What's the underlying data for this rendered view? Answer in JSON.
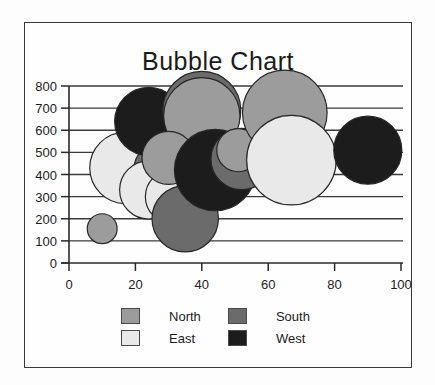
{
  "chart_data": {
    "type": "scatter",
    "title": "Bubble Chart",
    "xlabel": "",
    "ylabel": "",
    "xlim": [
      0,
      100
    ],
    "ylim": [
      0,
      800
    ],
    "xticks": [
      "0",
      "20",
      "40",
      "60",
      "80",
      "100"
    ],
    "yticks": [
      "0",
      "100",
      "200",
      "300",
      "400",
      "500",
      "600",
      "700",
      "800"
    ],
    "grid": "horizontal",
    "legend_position": "bottom",
    "series": [
      {
        "name": "North",
        "color": "#9c9c9c",
        "points": [
          {
            "x": 10,
            "y": 155,
            "size": 90
          },
          {
            "x": 40,
            "y": 665,
            "size": 230
          },
          {
            "x": 30,
            "y": 475,
            "size": 160
          },
          {
            "x": 51,
            "y": 510,
            "size": 130
          },
          {
            "x": 65,
            "y": 680,
            "size": 255
          }
        ]
      },
      {
        "name": "East",
        "color": "#e9e9e9",
        "points": [
          {
            "x": 17,
            "y": 430,
            "size": 215
          },
          {
            "x": 24,
            "y": 330,
            "size": 175
          },
          {
            "x": 31,
            "y": 300,
            "size": 160
          },
          {
            "x": 67,
            "y": 465,
            "size": 270
          }
        ]
      },
      {
        "name": "South",
        "color": "#6b6b6b",
        "points": [
          {
            "x": 40,
            "y": 690,
            "size": 235
          },
          {
            "x": 28,
            "y": 420,
            "size": 170
          },
          {
            "x": 35,
            "y": 200,
            "size": 200
          },
          {
            "x": 52,
            "y": 470,
            "size": 185
          }
        ]
      },
      {
        "name": "West",
        "color": "#1c1c1c",
        "points": [
          {
            "x": 24,
            "y": 640,
            "size": 205
          },
          {
            "x": 44,
            "y": 420,
            "size": 245
          },
          {
            "x": 90,
            "y": 510,
            "size": 205
          }
        ]
      }
    ]
  },
  "legend": {
    "entries": [
      {
        "label": "North",
        "color": "#9c9c9c"
      },
      {
        "label": "South",
        "color": "#6b6b6b"
      },
      {
        "label": "East",
        "color": "#e9e9e9"
      },
      {
        "label": "West",
        "color": "#1c1c1c"
      }
    ]
  },
  "axes": {
    "tick_color": "#1b1b1b",
    "axis_color": "#2a2a2a",
    "grid_color": "#3a3a3a"
  }
}
